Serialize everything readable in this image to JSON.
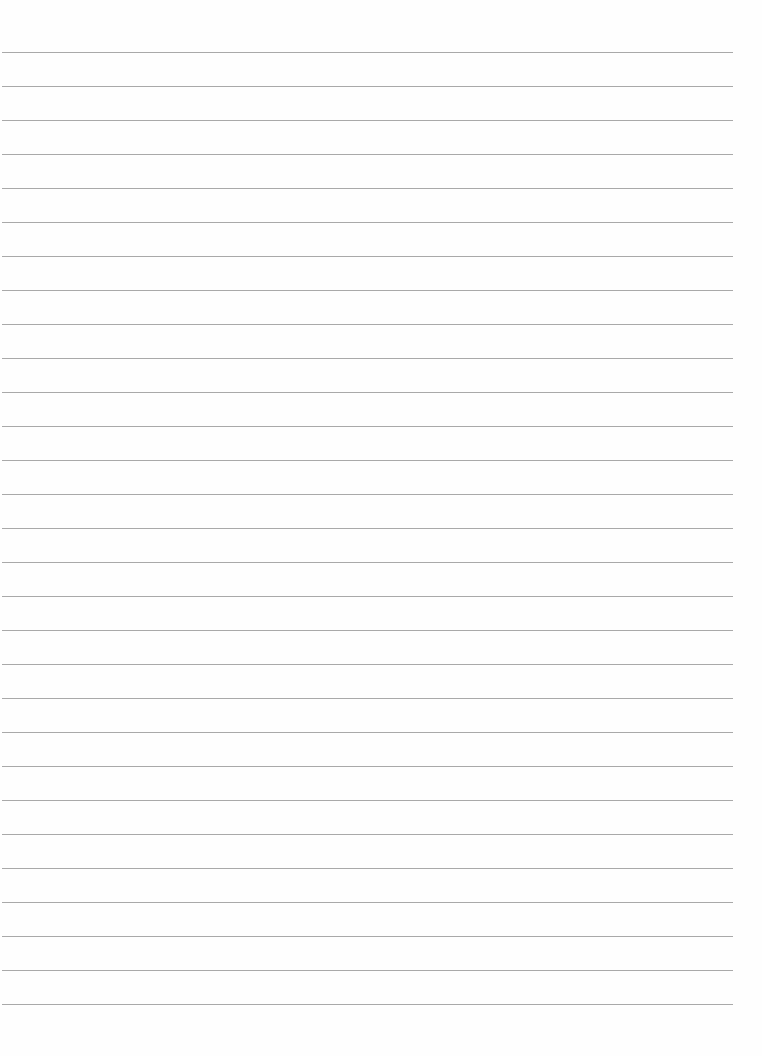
{
  "page": {
    "type": "ruled-paper",
    "background_color": "#fefefe",
    "line_color": "#9a9a9a",
    "line_count": 29,
    "first_line_y": 52,
    "line_spacing": 34,
    "line_left": 2,
    "line_right": 733,
    "text": ""
  }
}
